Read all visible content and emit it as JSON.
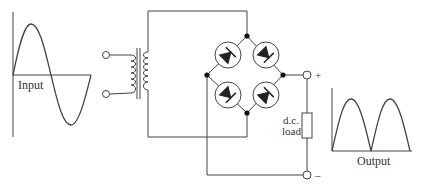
{
  "diagram": {
    "labels": {
      "input": "Input",
      "output": "Output",
      "load_line1": "d.c.",
      "load_line2": "load",
      "plus": "+",
      "minus": "–"
    },
    "components": {
      "input_waveform": "sine wave",
      "transformer": "transformer",
      "bridge": "four-diode bridge",
      "load": "d.c. load resistor",
      "output_waveform": "full-wave rectified"
    },
    "colors": {
      "line": "#444444",
      "fill": "#222222",
      "background": "#ffffff"
    }
  }
}
